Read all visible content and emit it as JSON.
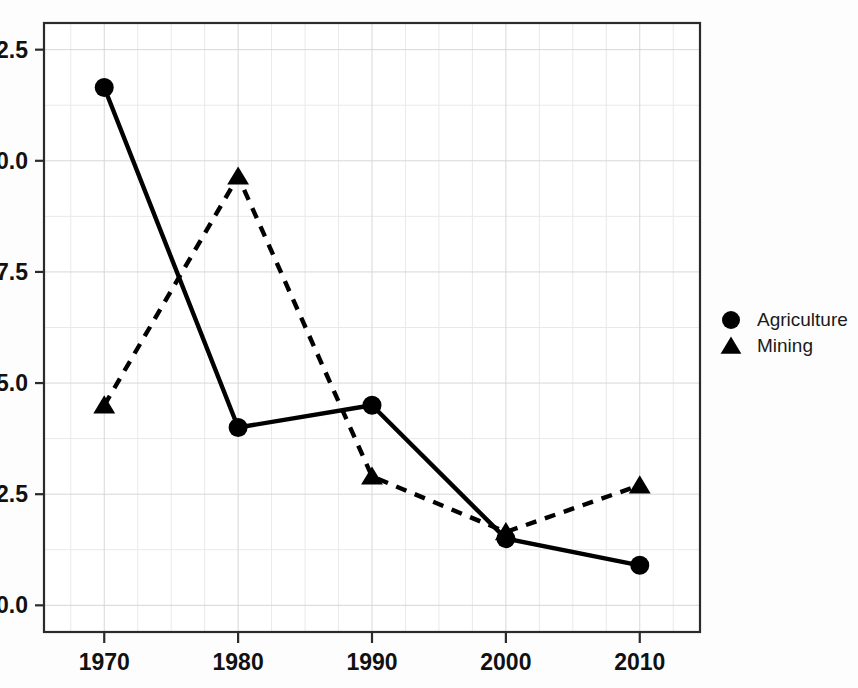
{
  "chart_data": {
    "type": "line",
    "title": "",
    "xlabel": "",
    "ylabel": "",
    "x": [
      1970,
      1980,
      1990,
      2000,
      2010
    ],
    "categories": [
      "1970",
      "1980",
      "1990",
      "2000",
      "2010"
    ],
    "series": [
      {
        "name": "Agriculture",
        "values": [
          11.65,
          4.0,
          4.5,
          1.5,
          0.9
        ],
        "marker": "circle",
        "linestyle": "solid",
        "color": "#000000"
      },
      {
        "name": "Mining",
        "values": [
          4.5,
          9.65,
          2.9,
          1.65,
          2.7
        ],
        "marker": "triangle",
        "linestyle": "dashed",
        "color": "#000000"
      }
    ],
    "xlim": [
      1965.5,
      2014.5
    ],
    "ylim": [
      -0.6,
      13.1
    ],
    "xticks": [
      1970,
      1980,
      1990,
      2000,
      2010
    ],
    "yticks": [
      0.0,
      2.5,
      5.0,
      7.5,
      10.0,
      12.5
    ],
    "xtick_labels": [
      "1970",
      "1980",
      "1990",
      "2000",
      "2010"
    ],
    "ytick_labels": [
      "0.0",
      "2.5",
      "5.0",
      "7.5",
      "10.0",
      "12.5"
    ],
    "grid": true,
    "legend_position": "right"
  },
  "axes": {
    "y_ticks": [
      {
        "label": "12.5",
        "value": 12.5
      },
      {
        "label": "10.0",
        "value": 10.0
      },
      {
        "label": "7.5",
        "value": 7.5
      },
      {
        "label": "5.0",
        "value": 5.0
      },
      {
        "label": "2.5",
        "value": 2.5
      },
      {
        "label": "0.0",
        "value": 0.0
      }
    ],
    "x_ticks": [
      {
        "label": "1970",
        "value": 1970
      },
      {
        "label": "1980",
        "value": 1980
      },
      {
        "label": "1990",
        "value": 1990
      },
      {
        "label": "2000",
        "value": 2000
      },
      {
        "label": "2010",
        "value": 2010
      }
    ]
  },
  "legend": {
    "entries": [
      {
        "label": "Agriculture",
        "marker": "circle-marker-icon"
      },
      {
        "label": "Mining",
        "marker": "triangle-marker-icon"
      }
    ]
  },
  "colors": {
    "foreground": "#000000",
    "axis": "#2b2b2b",
    "grid_major": "#d7d7d7",
    "grid_minor": "#e9e9e9",
    "background": "#fdfdfd"
  }
}
